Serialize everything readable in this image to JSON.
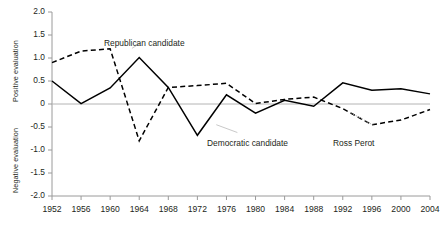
{
  "chart_data": {
    "type": "line",
    "title": "",
    "xlabel": "",
    "ylabel_positive": "Positive evaluation",
    "ylabel_negative": "Negative evaluation",
    "grid": false,
    "legend_position": "inline-annotations",
    "x": [
      1952,
      1956,
      1960,
      1964,
      1968,
      1972,
      1976,
      1980,
      1984,
      1988,
      1992,
      1996,
      2000,
      2004
    ],
    "xlim": [
      1952,
      2004
    ],
    "ylim": [
      -2.0,
      2.0
    ],
    "yticks": [
      "2.0",
      "1.5",
      "1.0",
      "0.5",
      "0",
      "-0.5",
      "-1.0",
      "-1.5",
      "-2.0"
    ],
    "ytick_values": [
      2.0,
      1.5,
      1.0,
      0.5,
      0,
      -0.5,
      -1.0,
      -1.5,
      -2.0
    ],
    "xticks": [
      "1952",
      "1956",
      "1960",
      "1964",
      "1968",
      "1972",
      "1976",
      "1980",
      "1984",
      "1988",
      "1992",
      "1996",
      "2000",
      "2004"
    ],
    "zero_line": 0,
    "series": [
      {
        "name": "Republican candidate",
        "style": "solid",
        "color": "#000000",
        "label_x": 1963,
        "label_y": 1.35,
        "values": [
          0.5,
          0.01,
          0.35,
          1.01,
          0.36,
          -0.68,
          0.2,
          -0.2,
          0.08,
          -0.05,
          0.46,
          0.3,
          0.33,
          0.22
        ]
      },
      {
        "name": "Democratic candidate",
        "style": "dashed",
        "color": "#000000",
        "label_x": 1980,
        "label_y": -0.62,
        "values": [
          0.9,
          1.15,
          1.2,
          -0.8,
          0.36,
          0.4,
          0.45,
          0.01,
          0.1,
          0.15,
          -0.1,
          -0.45,
          -0.35,
          -0.12
        ]
      },
      {
        "name": "Ross Perot",
        "style": "annotation-only",
        "color": "#000000",
        "label_x": 1996,
        "label_y": -0.62,
        "pointer_to_x": 1994,
        "pointer_to_y": -0.3
      }
    ],
    "annotations": [
      {
        "text": "Republican candidate",
        "name": "republican-label"
      },
      {
        "text": "Democratic candidate",
        "name": "democratic-label"
      },
      {
        "text": "Ross Perot",
        "name": "ross-perot-label"
      }
    ]
  }
}
